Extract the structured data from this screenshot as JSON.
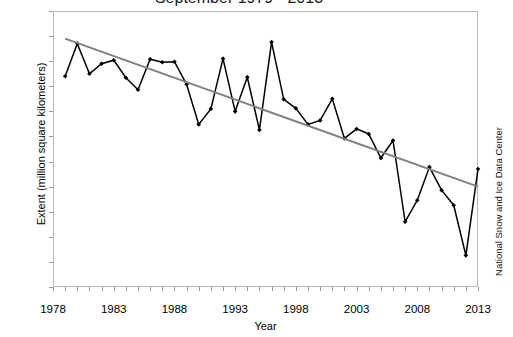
{
  "chart_data": {
    "type": "line",
    "title": "September 1979 - 2013",
    "xlabel": "Year",
    "ylabel": "Extent (million square kilometers)",
    "credit": "National Snow and Ice Data Center",
    "xlim": [
      1978,
      2013
    ],
    "ylim": [
      3.0,
      8.5
    ],
    "ytick_labels": [
      "3.0",
      "3.5",
      "4.0",
      "4.5",
      "5.0",
      "5.5",
      "6.0",
      "6.5",
      "7.0",
      "7.5",
      "8.0",
      "8.5"
    ],
    "ytick_values": [
      3.0,
      3.5,
      4.0,
      4.5,
      5.0,
      5.5,
      6.0,
      6.5,
      7.0,
      7.5,
      8.0,
      8.5
    ],
    "xtick_labels": [
      "1978",
      "1983",
      "1988",
      "1993",
      "1998",
      "2003",
      "2008",
      "2013"
    ],
    "xtick_values": [
      1978,
      1983,
      1988,
      1993,
      1998,
      2003,
      2008,
      2013
    ],
    "grid": false,
    "legend": "none",
    "series": [
      {
        "name": "September sea ice extent",
        "marker": "diamond",
        "color": "#000000",
        "x": [
          1979,
          1980,
          1981,
          1982,
          1983,
          1984,
          1985,
          1986,
          1987,
          1988,
          1989,
          1990,
          1991,
          1992,
          1993,
          1994,
          1995,
          1996,
          1997,
          1998,
          1999,
          2000,
          2001,
          2002,
          2003,
          2004,
          2005,
          2006,
          2007,
          2008,
          2009,
          2010,
          2011,
          2012,
          2013
        ],
        "values": [
          7.2,
          7.85,
          7.25,
          7.45,
          7.52,
          7.17,
          6.93,
          7.54,
          7.48,
          7.49,
          7.04,
          6.24,
          6.55,
          7.55,
          6.5,
          7.18,
          6.13,
          7.88,
          6.74,
          6.56,
          6.24,
          6.32,
          6.75,
          5.96,
          6.15,
          6.05,
          5.57,
          5.92,
          4.3,
          4.73,
          5.39,
          4.93,
          4.63,
          3.63,
          5.35
        ]
      },
      {
        "name": "Linear trend",
        "marker": "none",
        "color": "#808080",
        "x": [
          1979,
          2013
        ],
        "values": [
          7.95,
          5.0
        ]
      }
    ]
  }
}
